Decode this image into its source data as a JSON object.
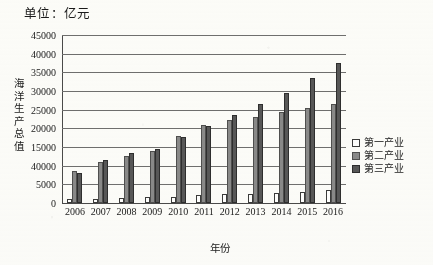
{
  "chart_data": {
    "type": "bar",
    "title": "单位：亿元",
    "xlabel": "年份",
    "ylabel": "海洋生产总值",
    "categories": [
      "2006",
      "2007",
      "2008",
      "2009",
      "2010",
      "2011",
      "2012",
      "2013",
      "2014",
      "2015",
      "2016"
    ],
    "series": [
      {
        "name": "第一产业",
        "color": "#ffffff",
        "values": [
          1100,
          1200,
          1300,
          1500,
          1700,
          2100,
          2300,
          2400,
          2600,
          3000,
          3400
        ]
      },
      {
        "name": "第二产业",
        "color": "#8a8a8a",
        "values": [
          8700,
          11000,
          12500,
          14000,
          18000,
          21000,
          22300,
          23000,
          24500,
          25500,
          26500
        ]
      },
      {
        "name": "第三产业",
        "color": "#585858",
        "values": [
          8000,
          11500,
          13500,
          14500,
          17800,
          20500,
          23500,
          26500,
          29500,
          33500,
          37500
        ]
      }
    ],
    "y_ticks": [
      "45000",
      "40000",
      "35000",
      "30000",
      "25000",
      "20000",
      "15000",
      "40000",
      "5000",
      "0"
    ],
    "y_tick_values": [
      45000,
      40000,
      35000,
      30000,
      25000,
      20000,
      15000,
      10000,
      5000,
      0
    ],
    "ylim": [
      0,
      45000
    ],
    "grid": true,
    "legend_position": "right"
  },
  "legend": {
    "items": [
      {
        "label": "第一产业"
      },
      {
        "label": "第二产业"
      },
      {
        "label": "第三产业"
      }
    ]
  }
}
